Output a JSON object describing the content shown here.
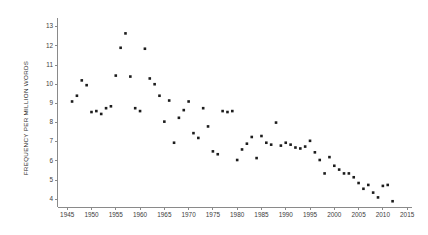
{
  "chart_data": {
    "type": "scatter",
    "title": "",
    "xlabel": "",
    "ylabel": "FREQUENCY PER MILLION WORDS",
    "xlim": [
      1943,
      2016
    ],
    "ylim": [
      3.6,
      13.4
    ],
    "grid": false,
    "legend": null,
    "marker": {
      "shape": "square",
      "color": "#1c1c1c",
      "size": 2.6
    },
    "axis_color": "#8a8a8a",
    "xticks": [
      1945,
      1950,
      1955,
      1960,
      1965,
      1970,
      1975,
      1980,
      1985,
      1990,
      1995,
      2000,
      2005,
      2010,
      2015
    ],
    "xtick_labels": [
      "1945",
      "1950",
      "1955",
      "1960",
      "1965",
      "1970",
      "1975",
      "1980",
      "1985",
      "1990",
      "1995",
      "2000",
      "2005",
      "2010",
      "2015"
    ],
    "yticks": [
      4,
      5,
      6,
      7,
      8,
      9,
      10,
      11,
      12,
      13
    ],
    "ytick_labels": [
      "4",
      "5",
      "6",
      "7",
      "8",
      "9",
      "10",
      "11",
      "12",
      "13"
    ],
    "x": [
      1946,
      1947,
      1948,
      1949,
      1950,
      1951,
      1952,
      1953,
      1954,
      1955,
      1956,
      1957,
      1958,
      1959,
      1960,
      1961,
      1962,
      1963,
      1964,
      1965,
      1966,
      1967,
      1968,
      1969,
      1970,
      1971,
      1972,
      1973,
      1974,
      1975,
      1976,
      1977,
      1978,
      1979,
      1980,
      1981,
      1982,
      1983,
      1984,
      1985,
      1986,
      1987,
      1988,
      1989,
      1990,
      1991,
      1992,
      1993,
      1994,
      1995,
      1996,
      1997,
      1998,
      1999,
      2000,
      2001,
      2002,
      2003,
      2004,
      2005,
      2006,
      2007,
      2008,
      2009,
      2010,
      2011,
      2012
    ],
    "y": [
      9.1,
      9.4,
      10.2,
      9.95,
      8.55,
      8.6,
      8.45,
      8.75,
      8.85,
      10.45,
      11.9,
      12.65,
      10.4,
      8.75,
      8.6,
      11.85,
      10.3,
      10.0,
      9.4,
      8.05,
      9.15,
      6.95,
      8.25,
      8.65,
      9.1,
      7.45,
      7.2,
      8.75,
      7.8,
      6.5,
      6.35,
      8.6,
      8.55,
      8.6,
      6.05,
      6.6,
      6.9,
      7.25,
      6.15,
      7.3,
      6.95,
      6.85,
      8.0,
      6.8,
      6.95,
      6.85,
      6.7,
      6.65,
      6.75,
      7.05,
      6.45,
      6.05,
      5.35,
      6.2,
      5.75,
      5.55,
      5.35,
      5.35,
      5.15,
      4.85,
      4.55,
      4.75,
      4.35,
      4.1,
      4.7,
      4.75,
      3.9
    ]
  },
  "axis_title": {
    "y": "FREQUENCY PER MILLION WORDS"
  }
}
